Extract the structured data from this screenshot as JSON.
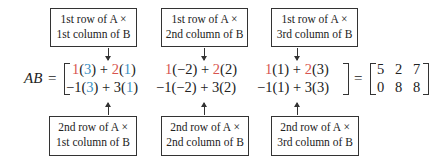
{
  "top_labels": [
    {
      "line1": "1st row of A ×",
      "line2": "1st column of B"
    },
    {
      "line1": "1st row of A ×",
      "line2": "2nd column of B"
    },
    {
      "line1": "1st row of A ×",
      "line2": "3rd column of B"
    }
  ],
  "bottom_labels": [
    {
      "line1": "2nd row of A ×",
      "line2": "1st column of B"
    },
    {
      "line1": "2nd row of A ×",
      "line2": "2nd column of B"
    },
    {
      "line1": "2nd row of A ×",
      "line2": "3rd column of B"
    }
  ],
  "equation": {
    "lhs": "AB",
    "equals": "=",
    "row1": [
      {
        "a": "1",
        "b1": "3",
        "plus": " + ",
        "c": "2",
        "b2": "1"
      },
      {
        "a": "1",
        "b1": "−2",
        "plus": " + ",
        "c": "2",
        "b2": "2"
      },
      {
        "a": "1",
        "b1": "1",
        "plus": " + ",
        "c": "2",
        "b2": "3"
      }
    ],
    "row2": [
      {
        "a": "−1",
        "b1": "3",
        "plus": " + ",
        "c": "3",
        "b2": "1"
      },
      {
        "a": "−1",
        "b1": "−2",
        "plus": " + ",
        "c": "3",
        "b2": "2"
      },
      {
        "a": "−1",
        "b1": "1",
        "plus": " + ",
        "c": "3",
        "b2": "3"
      }
    ],
    "result": [
      [
        "5",
        "2",
        "7"
      ],
      [
        "0",
        "8",
        "8"
      ]
    ]
  },
  "colors": {
    "row_a_highlight": "#d8544f",
    "col_b_highlight": "#3a8fc4"
  }
}
